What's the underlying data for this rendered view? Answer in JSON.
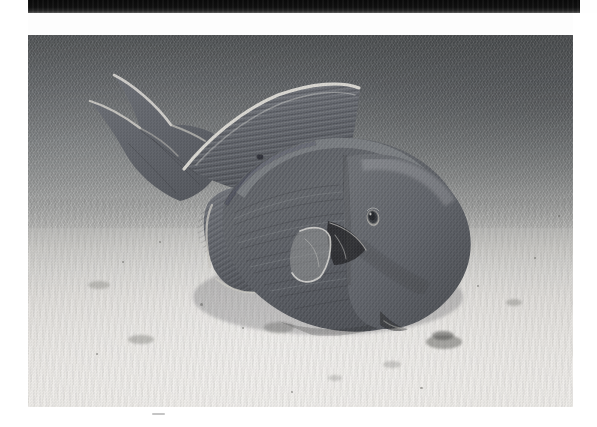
{
  "figure": {
    "panel_label": "G",
    "caption": "",
    "media_type": "black-and-white underwater photograph"
  },
  "layout": {
    "page_width": 597,
    "page_height": 427,
    "photo": {
      "x": 28,
      "y": 35,
      "width": 545,
      "height": 372
    },
    "top_band": {
      "x": 27,
      "y": 0,
      "width": 553,
      "height": 13
    },
    "label_position": {
      "x": 10,
      "y": 34
    }
  },
  "colors": {
    "page_background": "#ffffff",
    "top_band": "#0a0a0a",
    "water_dark": "#4e5153",
    "water_mid": "#7b7e7f",
    "sand_light": "#edebe8",
    "fish_body": "#61646a",
    "fish_body_dark": "#4a4d53",
    "fish_fin_highlight": "#d8d6d0",
    "label_text": "#1c1c1c"
  },
  "scene": {
    "background_description": "dark blue-grey open water at top fading to bright white sand at the bottom",
    "foreground_description": "rippled sand bottom with scattered dark debris",
    "debris_clusters": [
      {
        "x": 430,
        "y": 342,
        "size": 26
      },
      {
        "x": 262,
        "y": 322,
        "size": 18
      },
      {
        "x": 130,
        "y": 337,
        "size": 12
      },
      {
        "x": 508,
        "y": 300,
        "size": 9
      },
      {
        "x": 455,
        "y": 222,
        "size": 8
      }
    ]
  },
  "fish": {
    "common_name": "triggerfish",
    "orientation": "head down and to the right, tail up and to the left",
    "parts": [
      {
        "name": "caudal-fin",
        "note": "deeply lunate tail with two long trailing lobes and pale leading edges"
      },
      {
        "name": "soft-dorsal-fin",
        "note": "tall rayed fin with bright curved leading margin"
      },
      {
        "name": "anal-fin",
        "note": "rayed fin mirroring the dorsal on the lower body"
      },
      {
        "name": "pectoral-fin",
        "note": "small pale crescent fin beside the gill slit"
      },
      {
        "name": "gill-slit",
        "note": "dark triangular slash behind the pectoral fin"
      },
      {
        "name": "eye",
        "note": "small pale-ringed eye set high and far back on the head"
      },
      {
        "name": "snout",
        "note": "blunt tapered snout angled down toward the sand"
      },
      {
        "name": "body",
        "note": "deep oval body with fine diagonal scale striations"
      }
    ]
  }
}
